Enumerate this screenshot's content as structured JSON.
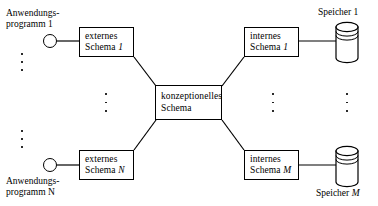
{
  "diagram": {
    "language": "de",
    "stroke_color": "#000000",
    "background_color": "#ffffff"
  },
  "applications": {
    "top": {
      "label_line1": "Anwendungs-",
      "label_line2": "programm 1"
    },
    "bottom": {
      "label_line1": "Anwendungs-",
      "label_line2": "programm N"
    }
  },
  "external_schemas": {
    "top": {
      "line1": "externes",
      "line2": "Schema",
      "index": "1"
    },
    "bottom": {
      "line1": "externes",
      "line2": "Schema",
      "index": "N"
    }
  },
  "conceptual_schema": {
    "line1": "konzeptionelles",
    "line2": "Schema"
  },
  "internal_schemas": {
    "top": {
      "line1": "internes",
      "line2": "Schema",
      "index": "1"
    },
    "bottom": {
      "line1": "internes",
      "line2": "Schema",
      "index": "M"
    }
  },
  "storages": {
    "top": {
      "label": "Speicher 1"
    },
    "bottom": {
      "label": "Speicher M"
    }
  },
  "ellipsis": {
    "glyph": "vertical-ellipsis",
    "count": 3
  }
}
